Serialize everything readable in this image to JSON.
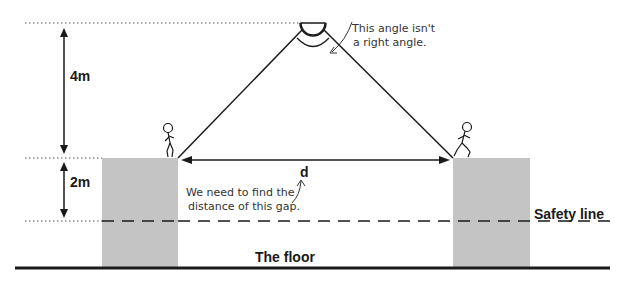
{
  "diagram": {
    "labels": {
      "height_upper": "4m",
      "height_lower": "2m",
      "gap": "d",
      "safety_line": "Safety line",
      "floor": "The floor"
    },
    "annotations": {
      "angle_note_line1": "This angle isn't",
      "angle_note_line2": "a right angle.",
      "gap_note_line1": "We need to find the",
      "gap_note_line2": "distance of this gap."
    },
    "colors": {
      "platform": "#c4c4c4",
      "line": "#1a1a1a",
      "background": "#ffffff"
    }
  }
}
